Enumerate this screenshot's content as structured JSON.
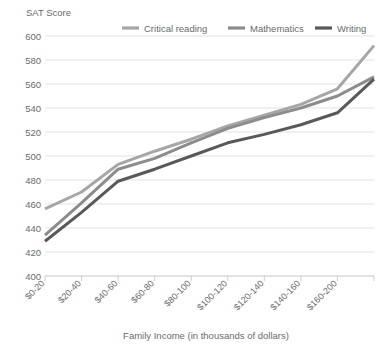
{
  "chart_data": {
    "type": "line",
    "title": "",
    "ylabel": "SAT Score",
    "xlabel": "Family Income (in thousands of dollars)",
    "categories": [
      "$0-20",
      "$20-40",
      "$40-60",
      "$60-80",
      "$80-100",
      "$100-120",
      "$120-140",
      "$140-160",
      "$160-200",
      ""
    ],
    "ylim": [
      400,
      600
    ],
    "ytick_step": 20,
    "yticks": [
      400,
      420,
      440,
      460,
      480,
      500,
      520,
      540,
      560,
      580,
      600
    ],
    "grid": true,
    "legend_position": "top",
    "series": [
      {
        "name": "Critical reading",
        "color": "#a6a6a6",
        "values": [
          456,
          470,
          493,
          504,
          514,
          525,
          534,
          543,
          556,
          592
        ]
      },
      {
        "name": "Mathematics",
        "color": "#8c8c8c",
        "values": [
          434,
          461,
          489,
          498,
          511,
          523,
          532,
          540,
          550,
          566
        ]
      },
      {
        "name": "Writing",
        "color": "#595959",
        "values": [
          429,
          453,
          479,
          489,
          500,
          511,
          518,
          526,
          536,
          564
        ]
      }
    ]
  },
  "colors": {
    "grid": "#d9d9d9",
    "axis": "#bfbfbf",
    "text": "#6b6b6b",
    "critical_reading": "#a6a6a6",
    "mathematics": "#8c8c8c",
    "writing": "#595959"
  }
}
